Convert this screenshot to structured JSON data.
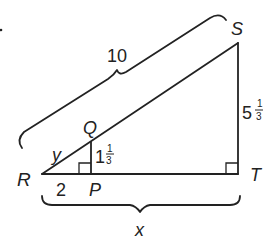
{
  "diagram": {
    "type": "similar-right-triangles",
    "vertices": {
      "R": "R",
      "S": "S",
      "T": "T",
      "Q": "Q",
      "P": "P"
    },
    "labels": {
      "RS": "10",
      "RQ": "y",
      "RP": "2",
      "QP_whole": "1",
      "QP_num": "1",
      "QP_den": "3",
      "ST_whole": "5",
      "ST_num": "1",
      "ST_den": "3",
      "RT": "x"
    },
    "marker": "."
  }
}
